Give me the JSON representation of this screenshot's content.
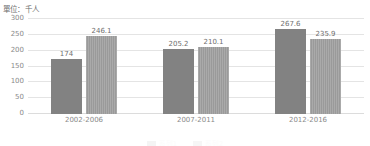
{
  "unit_label": "單位：千人",
  "chart_data": {
    "type": "bar",
    "title": "",
    "xlabel": "",
    "ylabel": "單位：千人",
    "ylim": [
      0,
      300
    ],
    "yticks": [
      300,
      250,
      200,
      150,
      100,
      50,
      0
    ],
    "grid": true,
    "legend_position": "bottom",
    "categories": [
      "2002-2006",
      "2007-2011",
      "2012-2016"
    ],
    "series": [
      {
        "name": "系列1",
        "color": "#828282",
        "values": [
          174,
          205.2,
          267.6
        ],
        "labels": [
          "174",
          "205.2",
          "267.6"
        ]
      },
      {
        "name": "系列2",
        "color": "#9a9a9a",
        "values": [
          246.1,
          210.1,
          235.9
        ],
        "labels": [
          "246.1",
          "210.1",
          "235.9"
        ]
      }
    ]
  }
}
